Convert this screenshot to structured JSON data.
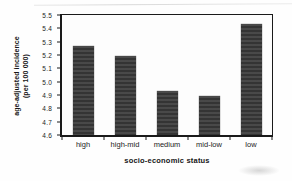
{
  "figure": {
    "y_axis_title_line1": "age-adjusted incidence",
    "y_axis_title_line2": "(per 100 000)",
    "x_axis_title": "socio-economic status"
  },
  "chart_data": {
    "type": "bar",
    "title": "",
    "categories": [
      "high",
      "high-mid",
      "medium",
      "mid-low",
      "low"
    ],
    "values": [
      5.27,
      5.19,
      4.93,
      4.89,
      5.43
    ],
    "xlabel": "socio-economic status",
    "ylabel": "age-adjusted incidence (per 100 000)",
    "ylim": [
      4.6,
      5.5
    ],
    "ytick_step": 0.1,
    "ytick_labels": [
      "4.6",
      "4.7",
      "4.8",
      "4.9",
      "5.0",
      "5.1",
      "5.2",
      "5.3",
      "5.4",
      "5.5"
    ],
    "bar_color": "#3b3b3b",
    "grid": false,
    "legend": "none"
  }
}
